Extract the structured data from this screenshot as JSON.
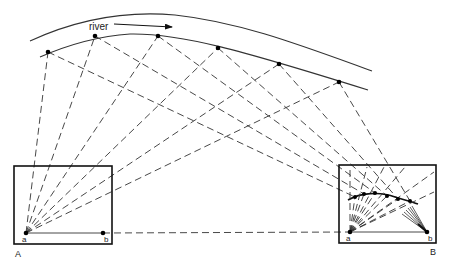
{
  "diagram": {
    "river_label": "river",
    "box_a": {
      "label": "A",
      "point_a_label": "a",
      "point_b_label": "b"
    },
    "box_b": {
      "label": "B",
      "point_a_label": "a",
      "point_b_label": "b"
    },
    "colors": {
      "line": "#333333",
      "background": "#ffffff"
    }
  }
}
